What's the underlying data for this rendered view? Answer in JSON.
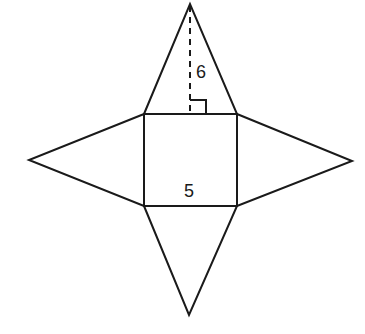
{
  "diagram": {
    "type": "net of square pyramid",
    "labels": {
      "height": "6",
      "base_side": "5"
    },
    "colors": {
      "stroke": "#1a1a1a",
      "background": "#ffffff"
    }
  }
}
